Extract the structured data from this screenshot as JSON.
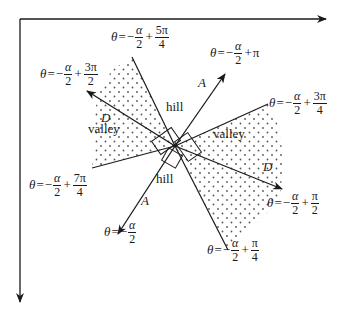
{
  "diagram": {
    "title": "",
    "axes": {
      "horizontal_arrow": true,
      "vertical_arrow": true
    },
    "region_labels": {
      "hill_top": "hill",
      "hill_bottom": "hill",
      "valley_left": "valley",
      "valley_right": "valley"
    },
    "direction_labels": {
      "A_top": "A",
      "A_bottom": "A",
      "D_left": "D",
      "D_right": "D"
    },
    "equations": {
      "eq_5pi4": {
        "lhs": "θ",
        "eq": "=",
        "minus": "−",
        "num1": "α",
        "den1": "2",
        "plus": "+",
        "num2": "5π",
        "den2": "4"
      },
      "eq_pi": {
        "lhs": "θ",
        "eq": "=",
        "minus": "−",
        "num1": "α",
        "den1": "2",
        "plus": "+",
        "term2": "π"
      },
      "eq_3pi2": {
        "lhs": "θ",
        "eq": "=",
        "minus": "−",
        "num1": "α",
        "den1": "2",
        "plus": "+",
        "num2": "3π",
        "den2": "2"
      },
      "eq_3pi4": {
        "lhs": "θ",
        "eq": "=",
        "minus": "−",
        "num1": "α",
        "den1": "2",
        "plus": "+",
        "num2": "3π",
        "den2": "4"
      },
      "eq_7pi4": {
        "lhs": "θ",
        "eq": "=",
        "minus": "−",
        "num1": "α",
        "den1": "2",
        "plus": "+",
        "num2": "7π",
        "den2": "4"
      },
      "eq_0": {
        "lhs": "θ",
        "eq": "=",
        "minus": "−",
        "num1": "α",
        "den1": "2"
      },
      "eq_pi2": {
        "lhs": "θ",
        "eq": "=",
        "minus": "−",
        "num1": "α",
        "den1": "2",
        "plus": "+",
        "num2": "π",
        "den2": "2"
      },
      "eq_pi4": {
        "lhs": "θ",
        "eq": "=",
        "minus": "−",
        "num1": "α",
        "den1": "2",
        "plus": "+",
        "num2": "π",
        "den2": "4"
      }
    },
    "colors": {
      "stroke": "#1a1a1a",
      "dots": "#555555",
      "background": "#ffffff"
    }
  }
}
